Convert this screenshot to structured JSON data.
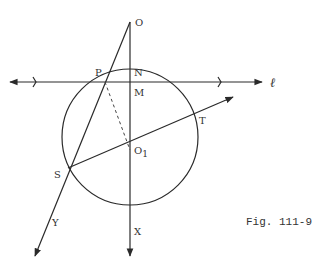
{
  "figure": {
    "caption": "Fig. 111-9",
    "labels": {
      "O": "O",
      "P": "P",
      "N": "N",
      "M": "M",
      "O1_main": "O",
      "O1_sub": "1",
      "T": "T",
      "S": "S",
      "Y": "Y",
      "X": "X",
      "ell": "ℓ"
    },
    "elements": {
      "circle": {
        "cx": 130,
        "cy": 137,
        "r": 68
      },
      "line_l": {
        "from": [
          8,
          82
        ],
        "to": [
          265,
          82
        ],
        "ticks": [
          35,
          220
        ]
      },
      "line_OX": {
        "from": [
          130,
          22
        ],
        "to": [
          130,
          258
        ]
      },
      "line_OY": {
        "from": [
          130,
          22
        ],
        "to": [
          34,
          258
        ]
      },
      "line_ST": {
        "from": [
          68,
          168
        ],
        "to": [
          234,
          97
        ]
      },
      "dashed_PO1": {
        "from": [
          105,
          82
        ],
        "to": [
          130,
          150
        ]
      }
    },
    "colors": {
      "stroke": "#2a2a2a",
      "text": "#333333",
      "background": "#ffffff"
    }
  }
}
